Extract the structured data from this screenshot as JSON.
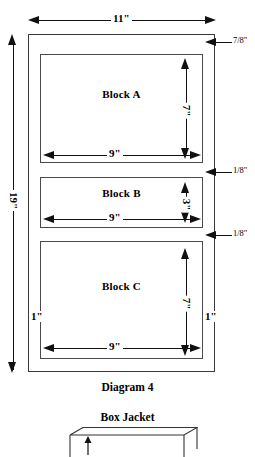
{
  "diagram": {
    "caption": "Diagram 4",
    "blocks": [
      {
        "name": "Block A",
        "width": "9\"",
        "height": "7\""
      },
      {
        "name": "Block B",
        "width": "9\"",
        "height": "3\""
      },
      {
        "name": "Block C",
        "width": "9\"",
        "height": "7\""
      }
    ],
    "overall": {
      "width": "11\"",
      "height": "19\""
    },
    "margins": {
      "top_gap": "7/8\"",
      "gap_a_b": "1/8\"",
      "gap_b_c": "1/8\"",
      "side_left": "1\"",
      "side_right": "1\""
    }
  },
  "box_jacket": {
    "caption": "Box Jacket"
  },
  "colors": {
    "ink": "#000000",
    "outline": "#3a3a3a",
    "paper": "#ffffff"
  }
}
